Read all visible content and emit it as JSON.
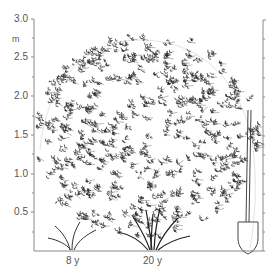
{
  "figure": {
    "y_unit": "m",
    "y_ticks": [
      "3.0",
      "2.5",
      "2.0",
      "1.5",
      "1.0",
      "0.5"
    ],
    "x_labels": [
      "8 y",
      "20 y"
    ],
    "colors": {
      "ink": "#333333",
      "axis": "#777777",
      "background": "#ffffff"
    }
  },
  "chart_data": {
    "type": "illustration",
    "title": "",
    "ylabel": "m",
    "ylim": [
      0,
      3.0
    ],
    "y_major_ticks": [
      0.5,
      1.0,
      1.5,
      2.0,
      2.5,
      3.0
    ],
    "y_minor_tick_step": 0.25,
    "stages": [
      {
        "label": "8 y",
        "approx_height_m": 1.2
      },
      {
        "label": "20 y",
        "approx_height_m": 2.7
      }
    ],
    "annotations": [
      "spade for scale at right"
    ]
  }
}
